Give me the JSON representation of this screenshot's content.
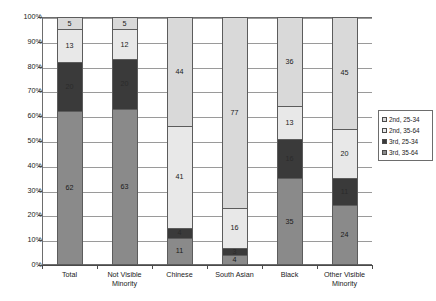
{
  "chart_data": {
    "type": "bar",
    "subtype": "100% stacked column",
    "title": "",
    "subtitle": "",
    "xlabel": "",
    "ylabel": "",
    "ylim": [
      0,
      100
    ],
    "ytick_labels": [
      "0%",
      "10%",
      "20%",
      "30%",
      "40%",
      "50%",
      "60%",
      "70%",
      "80%",
      "90%",
      "100%"
    ],
    "ytick_values": [
      0,
      10,
      20,
      30,
      40,
      50,
      60,
      70,
      80,
      90,
      100
    ],
    "grid": true,
    "grid_axis": "y",
    "legend_position": "right",
    "categories": [
      "Total",
      "Not Visible Minority",
      "Chinese",
      "South Asian",
      "Black",
      "Other Visible Minority"
    ],
    "series": [
      {
        "name": "2nd, 25-34",
        "color": "#d9d9d9",
        "stack_order": 3,
        "values": [
          5,
          5,
          44,
          77,
          36,
          45
        ]
      },
      {
        "name": "2nd, 35-64",
        "color": "#e8e8e8",
        "stack_order": 2,
        "values": [
          13,
          12,
          41,
          16,
          13,
          20
        ]
      },
      {
        "name": "3rd, 25-34",
        "color": "#3a3a3a",
        "stack_order": 1,
        "values": [
          20,
          20,
          4,
          3,
          16,
          11
        ]
      },
      {
        "name": "3rd, 35-64",
        "color": "#8a8a8a",
        "stack_order": 0,
        "values": [
          62,
          63,
          11,
          4,
          35,
          24
        ]
      }
    ]
  },
  "colors": {
    "series_2nd_25_34": "#d9d9d9",
    "series_2nd_35_64": "#e8e8e8",
    "series_3rd_25_34": "#3a3a3a",
    "series_3rd_35_64": "#8a8a8a",
    "axis": "#4a4a4a",
    "grid": "#9a9a9a",
    "text": "#1a1a1a",
    "background": "#ffffff"
  }
}
